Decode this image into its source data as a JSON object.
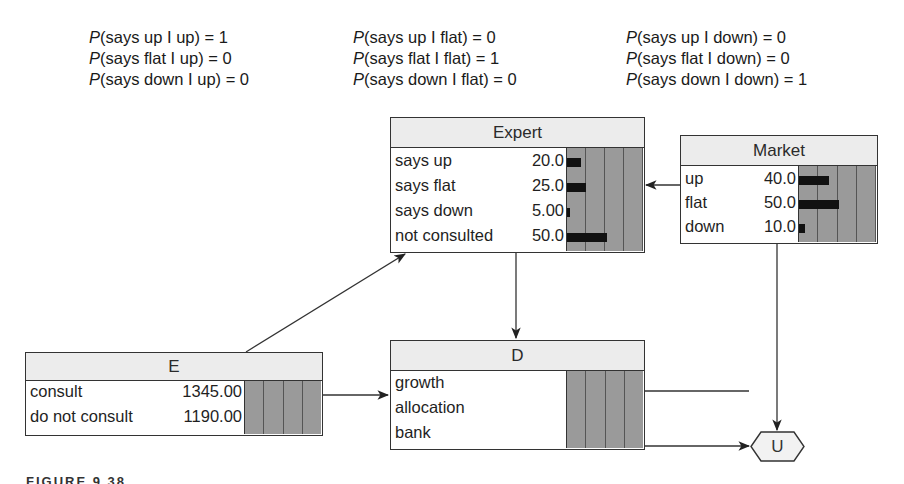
{
  "conditional_probabilities": {
    "given_up": [
      {
        "p": "P",
        "expr": "(says up I up) = 1"
      },
      {
        "p": "P",
        "expr": "(says flat I up) = 0"
      },
      {
        "p": "P",
        "expr": "(says down I up) = 0"
      }
    ],
    "given_flat": [
      {
        "p": "P",
        "expr": "(says up I flat) = 0"
      },
      {
        "p": "P",
        "expr": "(says flat I flat) = 1"
      },
      {
        "p": "P",
        "expr": "(says down I flat) = 0"
      }
    ],
    "given_down": [
      {
        "p": "P",
        "expr": "(says up I down) = 0"
      },
      {
        "p": "P",
        "expr": "(says flat I down) = 0"
      },
      {
        "p": "P",
        "expr": "(says down I down) = 1"
      }
    ]
  },
  "nodes": {
    "expert": {
      "title": "Expert",
      "states": [
        {
          "label": "says up",
          "value": "20.0",
          "pct": 20
        },
        {
          "label": "says flat",
          "value": "25.0",
          "pct": 25
        },
        {
          "label": "says down",
          "value": "5.00",
          "pct": 5
        },
        {
          "label": "not consulted",
          "value": "50.0",
          "pct": 50
        }
      ]
    },
    "market": {
      "title": "Market",
      "states": [
        {
          "label": "up",
          "value": "40.0",
          "pct": 40
        },
        {
          "label": "flat",
          "value": "50.0",
          "pct": 50
        },
        {
          "label": "down",
          "value": "10.0",
          "pct": 10
        }
      ]
    },
    "e": {
      "title": "E",
      "states": [
        {
          "label": "consult",
          "value": "1345.00"
        },
        {
          "label": "do not consult",
          "value": "1190.00"
        }
      ]
    },
    "d": {
      "title": "D",
      "states": [
        {
          "label": "growth"
        },
        {
          "label": "allocation"
        },
        {
          "label": "bank"
        }
      ]
    },
    "u": {
      "title": "U"
    }
  },
  "caption": "FIGURE 9.38"
}
